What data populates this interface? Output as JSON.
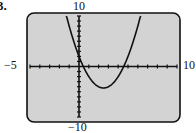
{
  "problem": {
    "label": "3."
  },
  "window": {
    "xmin_label": "−5",
    "xmax_label": "10",
    "ymax_label": "10",
    "ymin_label": "−10"
  },
  "colors": {
    "screen_bg": "#d3d3d3",
    "border": "#111111",
    "axis": "#111111",
    "curve": "#111111"
  },
  "chart_data": {
    "type": "line",
    "title": "",
    "xlabel": "",
    "ylabel": "",
    "xlim": [
      -5,
      10
    ],
    "ylim": [
      -10,
      10
    ],
    "xscale": 1,
    "yscale": 1,
    "grid": false,
    "legend": null,
    "series": [
      {
        "name": "y = x^2 - 5x + 2",
        "x": [
          -1.3,
          -1,
          -0.5,
          0,
          0.44,
          1,
          1.5,
          2,
          2.5,
          3,
          3.5,
          4,
          4.56,
          5,
          5.5,
          6,
          6.3
        ],
        "values": [
          10.19,
          8,
          4.75,
          2,
          0,
          -2,
          -3.25,
          -4,
          -4.25,
          -4,
          -3.25,
          -2,
          0,
          2,
          4.75,
          8,
          10.19
        ]
      }
    ],
    "annotations": {
      "vertex": [
        2.5,
        -4.25
      ],
      "x_intercepts": [
        0.44,
        4.56
      ],
      "y_intercept": 2
    }
  }
}
